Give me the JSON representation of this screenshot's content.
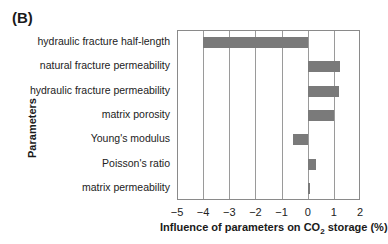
{
  "panel_label": "(B)",
  "chart_data": {
    "type": "bar",
    "orientation": "horizontal",
    "title": "",
    "xlabel": "Influence of parameters on CO2 storage (%)",
    "ylabel": "Parameters",
    "xlim": [
      -5,
      2
    ],
    "xticks": [
      -5,
      -4,
      -3,
      -2,
      -1,
      0,
      1,
      2
    ],
    "grid": "vertical",
    "legend": "none",
    "categories": [
      "hydraulic fracture half-length",
      "natural fracture permeability",
      "hydraulic fracture permeability",
      "matrix porosity",
      "Young's modulus",
      "Poisson's ratio",
      "matrix permeability"
    ],
    "values": [
      -4.0,
      1.25,
      1.2,
      1.0,
      -0.55,
      0.3,
      0.08
    ],
    "bar_color": "#7a7a7a"
  },
  "xlabel_parts": {
    "pre": "Influence of parameters on CO",
    "sub": "2",
    "post": " storage (%)"
  },
  "xtick_labels": [
    "−5",
    "−4",
    "−3",
    "−2",
    "−1",
    "0",
    "1",
    "2"
  ]
}
